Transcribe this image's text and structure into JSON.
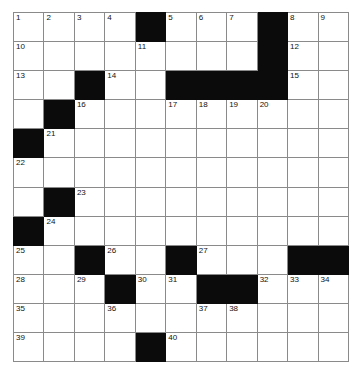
{
  "puzzle": {
    "type": "crossword-grid",
    "columns": 10,
    "rows": 12,
    "colors": {
      "block": "#0b0b0b",
      "empty": "#ffffff",
      "gridline": "#8a8a8a",
      "number": "#111111"
    },
    "cells": [
      [
        {
          "number": "1",
          "block": false
        },
        {
          "number": "2",
          "block": false
        },
        {
          "number": "3",
          "block": false
        },
        {
          "number": "4",
          "block": false
        },
        {
          "number": "",
          "block": true
        },
        {
          "number": "5",
          "block": false
        },
        {
          "number": "6",
          "block": false
        },
        {
          "number": "7",
          "block": false
        },
        {
          "number": "",
          "block": true
        },
        {
          "number": "8",
          "block": false
        },
        {
          "number": "9",
          "block": false
        }
      ],
      [
        {
          "number": "10",
          "block": false
        },
        {
          "number": "",
          "block": false
        },
        {
          "number": "",
          "block": false
        },
        {
          "number": "",
          "block": false
        },
        {
          "number": "11",
          "block": false
        },
        {
          "number": "",
          "block": false
        },
        {
          "number": "",
          "block": false
        },
        {
          "number": "",
          "block": false
        },
        {
          "number": "",
          "block": true
        },
        {
          "number": "12",
          "block": false
        },
        {
          "number": "",
          "block": false
        }
      ],
      [
        {
          "number": "13",
          "block": false
        },
        {
          "number": "",
          "block": false
        },
        {
          "number": "",
          "block": true
        },
        {
          "number": "14",
          "block": false
        },
        {
          "number": "",
          "block": false
        },
        {
          "number": "",
          "block": true
        },
        {
          "number": "",
          "block": true
        },
        {
          "number": "",
          "block": true
        },
        {
          "number": "",
          "block": true
        },
        {
          "number": "15",
          "block": false
        },
        {
          "number": "",
          "block": false
        }
      ],
      [
        {
          "number": "",
          "block": false
        },
        {
          "number": "",
          "block": true
        },
        {
          "number": "16",
          "block": false
        },
        {
          "number": "",
          "block": false
        },
        {
          "number": "",
          "block": false
        },
        {
          "number": "17",
          "block": false
        },
        {
          "number": "18",
          "block": false
        },
        {
          "number": "19",
          "block": false
        },
        {
          "number": "20",
          "block": false
        },
        {
          "number": "",
          "block": false
        },
        {
          "number": "",
          "block": false
        }
      ],
      [
        {
          "number": "",
          "block": true
        },
        {
          "number": "21",
          "block": false
        },
        {
          "number": "",
          "block": false
        },
        {
          "number": "",
          "block": false
        },
        {
          "number": "",
          "block": false
        },
        {
          "number": "",
          "block": false
        },
        {
          "number": "",
          "block": false
        },
        {
          "number": "",
          "block": false
        },
        {
          "number": "",
          "block": false
        },
        {
          "number": "",
          "block": false
        },
        {
          "number": "",
          "block": false
        }
      ],
      [
        {
          "number": "22",
          "block": false
        },
        {
          "number": "",
          "block": false
        },
        {
          "number": "",
          "block": false
        },
        {
          "number": "",
          "block": false
        },
        {
          "number": "",
          "block": false
        },
        {
          "number": "",
          "block": false
        },
        {
          "number": "",
          "block": false
        },
        {
          "number": "",
          "block": false
        },
        {
          "number": "",
          "block": false
        },
        {
          "number": "",
          "block": false
        },
        {
          "number": "",
          "block": false
        }
      ],
      [
        {
          "number": "",
          "block": false
        },
        {
          "number": "",
          "block": true
        },
        {
          "number": "23",
          "block": false
        },
        {
          "number": "",
          "block": false
        },
        {
          "number": "",
          "block": false
        },
        {
          "number": "",
          "block": false
        },
        {
          "number": "",
          "block": false
        },
        {
          "number": "",
          "block": false
        },
        {
          "number": "",
          "block": false
        },
        {
          "number": "",
          "block": false
        },
        {
          "number": "",
          "block": false
        }
      ],
      [
        {
          "number": "",
          "block": true
        },
        {
          "number": "24",
          "block": false
        },
        {
          "number": "",
          "block": false
        },
        {
          "number": "",
          "block": false
        },
        {
          "number": "",
          "block": false
        },
        {
          "number": "",
          "block": false
        },
        {
          "number": "",
          "block": false
        },
        {
          "number": "",
          "block": false
        },
        {
          "number": "",
          "block": false
        },
        {
          "number": "",
          "block": false
        },
        {
          "number": "",
          "block": false
        }
      ],
      [
        {
          "number": "25",
          "block": false
        },
        {
          "number": "",
          "block": false
        },
        {
          "number": "",
          "block": true
        },
        {
          "number": "26",
          "block": false
        },
        {
          "number": "",
          "block": false
        },
        {
          "number": "",
          "block": true
        },
        {
          "number": "27",
          "block": false
        },
        {
          "number": "",
          "block": false
        },
        {
          "number": "",
          "block": false
        },
        {
          "number": "",
          "block": true
        },
        {
          "number": "",
          "block": true
        }
      ],
      [
        {
          "number": "28",
          "block": false
        },
        {
          "number": "",
          "block": false
        },
        {
          "number": "29",
          "block": false
        },
        {
          "number": "",
          "block": true
        },
        {
          "number": "30",
          "block": false
        },
        {
          "number": "31",
          "block": false
        },
        {
          "number": "",
          "block": true
        },
        {
          "number": "",
          "block": true
        },
        {
          "number": "32",
          "block": false
        },
        {
          "number": "33",
          "block": false
        },
        {
          "number": "34",
          "block": false
        }
      ],
      [
        {
          "number": "35",
          "block": false
        },
        {
          "number": "",
          "block": false
        },
        {
          "number": "",
          "block": false
        },
        {
          "number": "36",
          "block": false
        },
        {
          "number": "",
          "block": false
        },
        {
          "number": "",
          "block": false
        },
        {
          "number": "37",
          "block": false
        },
        {
          "number": "38",
          "block": false
        },
        {
          "number": "",
          "block": false
        },
        {
          "number": "",
          "block": false
        },
        {
          "number": "",
          "block": false
        }
      ],
      [
        {
          "number": "39",
          "block": false
        },
        {
          "number": "",
          "block": false
        },
        {
          "number": "",
          "block": false
        },
        {
          "number": "",
          "block": false
        },
        {
          "number": "",
          "block": true
        },
        {
          "number": "40",
          "block": false
        },
        {
          "number": "",
          "block": false
        },
        {
          "number": "",
          "block": false
        },
        {
          "number": "",
          "block": false
        },
        {
          "number": "",
          "block": false
        },
        {
          "number": "",
          "block": false
        }
      ]
    ]
  }
}
